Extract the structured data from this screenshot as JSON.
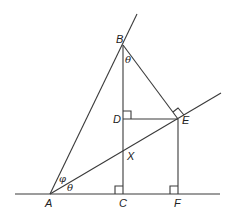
{
  "diagram": {
    "points": {
      "A": {
        "label": "A",
        "x": 50,
        "y": 194
      },
      "B": {
        "label": "B",
        "x": 123,
        "y": 45
      },
      "C": {
        "label": "C",
        "x": 123,
        "y": 194
      },
      "D": {
        "label": "D",
        "x": 123,
        "y": 119
      },
      "E": {
        "label": "E",
        "x": 178,
        "y": 119
      },
      "F": {
        "label": "F",
        "x": 178,
        "y": 194
      },
      "X": {
        "label": "X",
        "x": 123,
        "y": 151
      }
    },
    "angles": {
      "theta_B": "θ",
      "theta_A": "θ",
      "phi_A": "φ"
    },
    "right_angles": [
      "C",
      "F",
      "D",
      "E"
    ],
    "line_color": "#3a3a3a"
  }
}
